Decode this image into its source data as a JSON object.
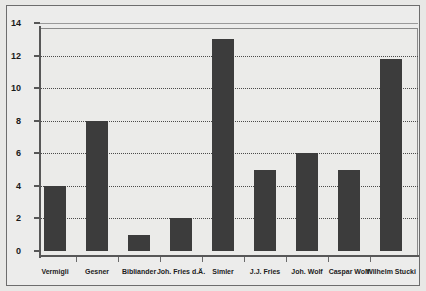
{
  "figure": {
    "background_color": "#ebebe9",
    "frame_color": "#6d6d6d",
    "bar_color": "#3c3c3c",
    "axis_color": "#575757",
    "grid_color": "#4a4a4a"
  },
  "chart_data": {
    "type": "bar",
    "title": "",
    "subtitle": "",
    "xlabel": "",
    "ylabel": "",
    "ylim": [
      0,
      14
    ],
    "yticks": [
      0,
      2,
      4,
      6,
      8,
      10,
      12,
      14
    ],
    "ytick_labels": [
      "0",
      "2",
      "4",
      "6",
      "8",
      "10",
      "12",
      "14"
    ],
    "grid": true,
    "grid_axis": "y",
    "grid_style": "dotted",
    "legend": false,
    "legend_position": "none",
    "categories": [
      "Vermigli",
      "Gesner",
      "Bibliander",
      "Joh. Fries d.Ä.",
      "Simler",
      "J.J. Fries",
      "Joh. Wolf",
      "Caspar Wolf",
      "Wilhelm Stucki"
    ],
    "values": [
      4,
      8,
      1,
      2,
      13,
      5,
      6,
      5,
      11.8
    ],
    "annotations": []
  }
}
